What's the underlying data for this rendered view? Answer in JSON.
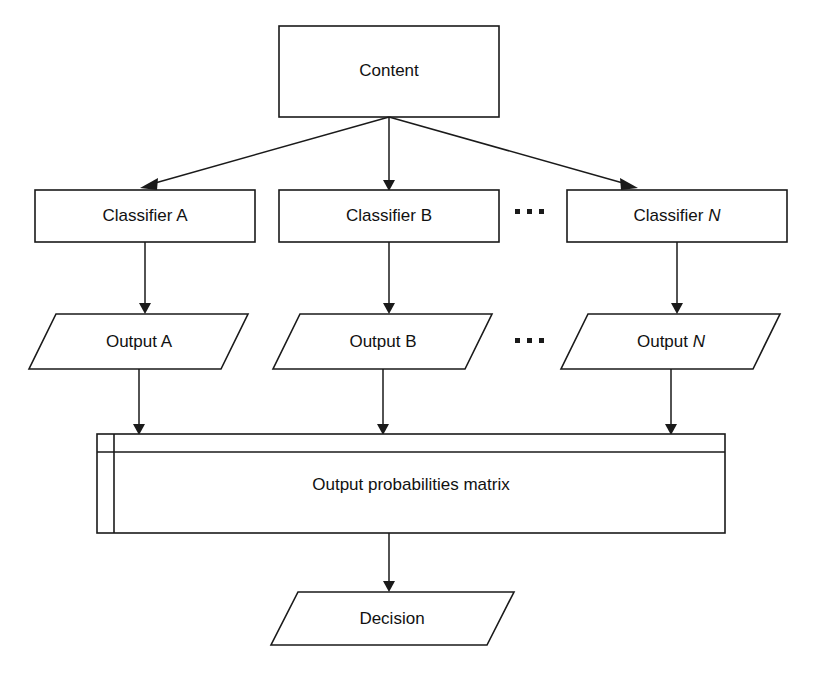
{
  "diagram": {
    "colors": {
      "background": "#ffffff",
      "stroke": "#1a1a1a",
      "text": "#111111",
      "fill": "#ffffff"
    },
    "nodes": {
      "content": {
        "label": "Content",
        "shape": "rectangle"
      },
      "classifier_a": {
        "label": "Classifier A",
        "shape": "rectangle"
      },
      "classifier_b": {
        "label": "Classifier B",
        "shape": "rectangle"
      },
      "classifier_n": {
        "label_prefix": "Classifier ",
        "label_italic": "N",
        "shape": "rectangle"
      },
      "output_a": {
        "label": "Output A",
        "shape": "parallelogram"
      },
      "output_b": {
        "label": "Output B",
        "shape": "parallelogram"
      },
      "output_n": {
        "label_prefix": "Output ",
        "label_italic": "N",
        "shape": "parallelogram"
      },
      "matrix": {
        "label": "Output probabilities matrix",
        "shape": "matrix-table"
      },
      "decision": {
        "label": "Decision",
        "shape": "parallelogram"
      }
    },
    "ellipses": {
      "classifier_row": "···",
      "output_row": "···"
    },
    "edges": [
      {
        "from": "content",
        "to": "classifier_a"
      },
      {
        "from": "content",
        "to": "classifier_b"
      },
      {
        "from": "content",
        "to": "classifier_n"
      },
      {
        "from": "classifier_a",
        "to": "output_a"
      },
      {
        "from": "classifier_b",
        "to": "output_b"
      },
      {
        "from": "classifier_n",
        "to": "output_n"
      },
      {
        "from": "output_a",
        "to": "matrix"
      },
      {
        "from": "output_b",
        "to": "matrix"
      },
      {
        "from": "output_n",
        "to": "matrix"
      },
      {
        "from": "matrix",
        "to": "decision"
      }
    ]
  }
}
